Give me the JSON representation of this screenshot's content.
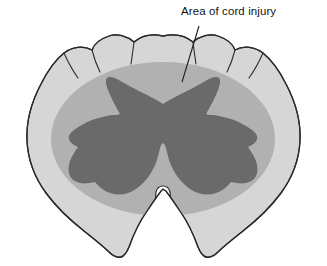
{
  "figure": {
    "kind": "anatomical-diagram",
    "annotations": [
      {
        "id": "area-of-cord-injury",
        "text": "Area of cord injury",
        "text_x": 181,
        "text_y": 5,
        "leader_line": {
          "x1": 199,
          "y1": 26,
          "x2": 182,
          "y2": 82
        }
      }
    ],
    "regions": [
      {
        "id": "white-matter",
        "name": "White matter (cord outline)",
        "fill": "#d6d6d6",
        "stroke": "#2b2b2b"
      },
      {
        "id": "injury-zone",
        "name": "Area of cord injury",
        "fill": "#b1b1b1",
        "stroke": "none"
      },
      {
        "id": "gray-matter",
        "name": "Gray matter (butterfly)",
        "fill": "#6a6a6a",
        "stroke": "none"
      },
      {
        "id": "anterior-median-fissure",
        "name": "Anterior median fissure",
        "fill": "#ffffff",
        "stroke": "#2b2b2b"
      }
    ],
    "colors": {
      "background": "#ffffff",
      "outline": "#2b2b2b",
      "white_matter": "#d6d6d6",
      "injury_zone": "#b1b1b1",
      "gray_matter": "#6a6a6a",
      "fissure": "#ffffff",
      "label_text": "#141414",
      "leader_line": "#1e1e1e"
    },
    "geometry": {
      "cord_outline_path": "M 163 36 C 150 33 141 36 134 42 C 127 36 117 33 109 36 C 100 39 94 44 92 50 C 83 45 72 47 64 53 C 54 61 47 72 41 84 C 32 101 26 121 27 141 C 28 160 35 178 46 193 C 57 208 70 220 84 231 C 94 239 103 246 109 252 C 113 256 117 258 121 257 C 125 256 127 252 129 247 C 134 233 140 221 147 211 C 153 202 158 195 161 191 L 163 189 L 166 191 C 169 195 174 202 180 211 C 187 221 193 233 198 247 C 200 252 202 256 206 257 C 210 258 214 256 218 252 C 224 246 233 239 243 231 C 257 220 270 208 281 193 C 292 178 299 160 300 141 C 301 121 295 101 286 84 C 280 72 273 61 263 53 C 255 47 244 45 235 50 C 233 44 227 39 218 36 C 210 33 200 36 193 42 C 186 36 176 33 163 36 Z",
      "scallop_notches": [
        "M 134 42 C 133 50 132 58 131 64",
        "M 193 42 C 194 50 195 58 196 64",
        "M 92 50 C 94 58 97 66 100 72",
        "M 235 50 C 233 58 230 66 227 72",
        "M 64 53 C 68 62 73 71 78 78",
        "M 263 53 C 259 62 254 71 249 78"
      ],
      "injury_ellipse": {
        "cx": 163,
        "cy": 139,
        "rx": 112,
        "ry": 77
      },
      "gray_matter_path": "M 163 104 C 156 99 147 95 139 91 C 131 87 124 83 117 79 C 113 77 109 76 107 78 C 105 80 106 85 108 90 C 111 98 116 107 120 114 C 118 115 115 115 112 115 C 105 116 98 118 92 120 C 85 123 79 126 74 130 C 70 133 68 136 69 139 C 70 143 74 145 78 147 C 75 151 72 156 70 161 C 68 167 68 172 70 176 C 72 180 76 182 80 183 C 85 184 90 183 95 182 C 99 187 104 191 110 193 C 116 195 122 195 128 193 C 134 191 139 187 143 183 C 147 179 150 175 152 171 C 155 166 157 161 158 156 C 159 152 160 148 161 145 L 163 143 L 165 145 C 166 148 167 152 168 156 C 169 161 171 166 174 171 C 176 175 179 179 183 183 C 187 187 192 191 198 193 C 204 195 210 195 216 193 C 222 191 227 187 231 182 C 236 183 241 184 246 183 C 250 182 254 180 256 176 C 258 172 258 167 256 161 C 254 156 251 151 248 147 C 252 145 256 143 257 139 C 258 136 256 133 252 130 C 247 126 241 123 234 120 C 228 118 221 116 214 115 C 211 115 208 115 206 114 C 210 107 215 98 218 90 C 220 85 221 80 219 78 C 217 76 213 77 209 79 C 202 83 195 87 187 91 C 179 95 170 99 163 104 Z",
      "fissure_path": "M 163 186 C 160 186 157 188 156 192 C 155 197 156 205 158 215 C 160 226 162 238 163 248 C 164 238 166 226 168 215 C 170 205 171 197 170 192 C 169 188 166 186 163 186 Z"
    }
  }
}
